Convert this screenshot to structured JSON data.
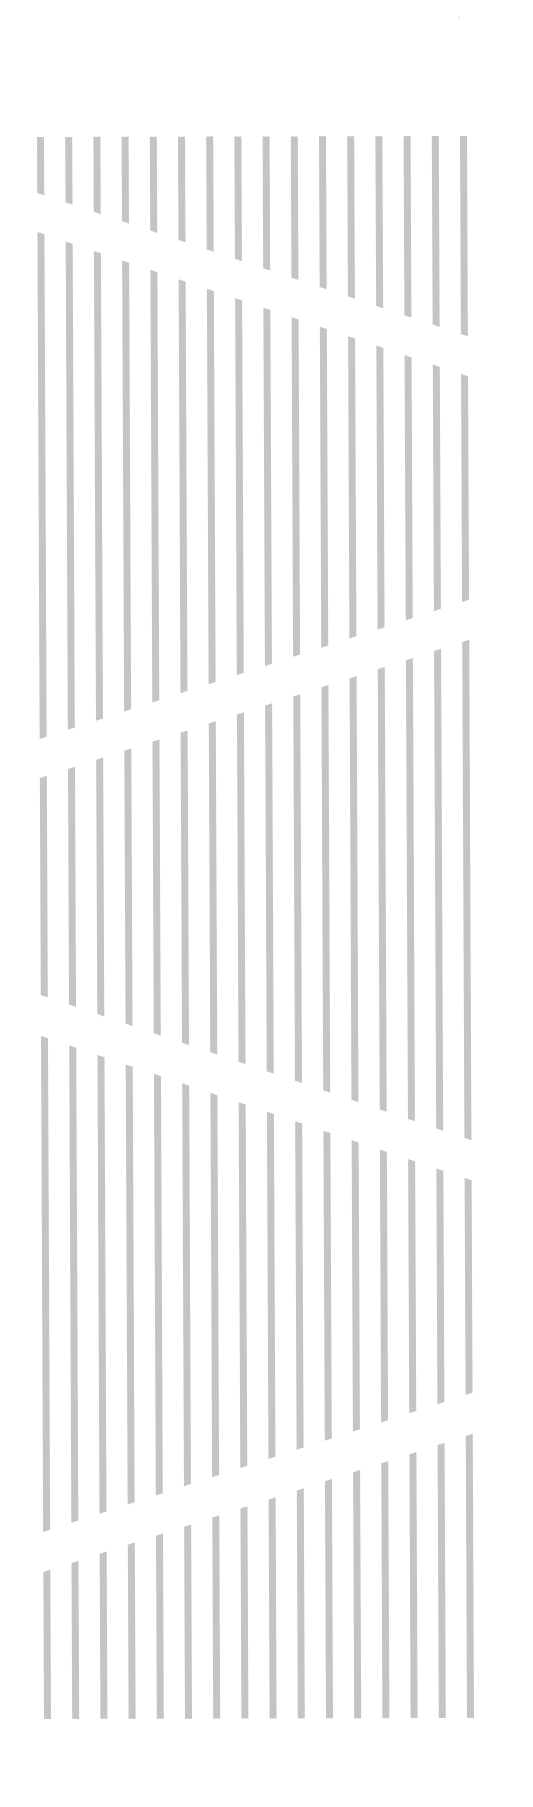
{
  "artwork": {
    "description": "Abstract graphic of vertical gray stripes interrupted by alternating diagonal white gaps",
    "bar_color": "#c4c4c4",
    "background_color": "#ffffff",
    "bar_count": 16,
    "bar_width": 7,
    "x_top_first": 37,
    "x_top_step": 28.2,
    "x_bottom_first": 44,
    "x_bottom_step": 28.2,
    "y_top": 136,
    "y_bottom": 1719,
    "bands": [
      {
        "top_left": 137,
        "top_right": 136,
        "bottom_left": 193,
        "bottom_right": 334
      },
      {
        "top_left": 232,
        "top_right": 374,
        "bottom_left": 739,
        "bottom_right": 602
      },
      {
        "top_left": 778,
        "top_right": 642,
        "bottom_left": 995,
        "bottom_right": 1138
      },
      {
        "top_left": 1036,
        "top_right": 1178,
        "bottom_left": 1532,
        "bottom_right": 1395
      },
      {
        "top_left": 1572,
        "top_right": 1436,
        "bottom_left": 1719,
        "bottom_right": 1718
      }
    ]
  }
}
